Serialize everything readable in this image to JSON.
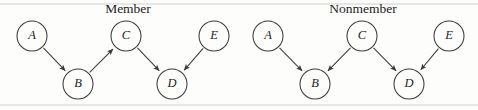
{
  "figure": {
    "width": 478,
    "height": 110,
    "background_color": "#fdfdfc",
    "stroke_color": "#3a3a3a",
    "rule_color": "#c9c9c7",
    "label_color": "#1c1c1c"
  },
  "rules": [
    {
      "name": "top-rule",
      "y": 4
    },
    {
      "name": "bottom-rule",
      "y": 105
    }
  ],
  "panels": [
    {
      "id": "member",
      "title": "Member",
      "title_x": 128,
      "title_y": 13,
      "nodes": [
        {
          "id": "A",
          "label": "A",
          "cx": 32,
          "cy": 36,
          "r": 15
        },
        {
          "id": "B",
          "label": "B",
          "cx": 78,
          "cy": 84,
          "r": 15
        },
        {
          "id": "C",
          "label": "C",
          "cx": 126,
          "cy": 36,
          "r": 15
        },
        {
          "id": "D",
          "label": "D",
          "cx": 172,
          "cy": 84,
          "r": 15
        },
        {
          "id": "E",
          "label": "E",
          "cx": 214,
          "cy": 36,
          "r": 15
        }
      ],
      "edges": [
        {
          "from": "A",
          "to": "B",
          "arrow": "to"
        },
        {
          "from": "B",
          "to": "C",
          "arrow": "to"
        },
        {
          "from": "C",
          "to": "D",
          "arrow": "to"
        },
        {
          "from": "E",
          "to": "D",
          "arrow": "to"
        }
      ]
    },
    {
      "id": "nonmember",
      "title": "Nonmember",
      "title_x": 363,
      "title_y": 13,
      "nodes": [
        {
          "id": "A",
          "label": "A",
          "cx": 268,
          "cy": 36,
          "r": 15
        },
        {
          "id": "B",
          "label": "B",
          "cx": 315,
          "cy": 84,
          "r": 15
        },
        {
          "id": "C",
          "label": "C",
          "cx": 362,
          "cy": 36,
          "r": 15
        },
        {
          "id": "D",
          "label": "D",
          "cx": 409,
          "cy": 84,
          "r": 15
        },
        {
          "id": "E",
          "label": "E",
          "cx": 449,
          "cy": 36,
          "r": 15
        }
      ],
      "edges": [
        {
          "from": "A",
          "to": "B",
          "arrow": "to"
        },
        {
          "from": "C",
          "to": "B",
          "arrow": "to"
        },
        {
          "from": "C",
          "to": "D",
          "arrow": "to"
        },
        {
          "from": "E",
          "to": "D",
          "arrow": "to"
        }
      ]
    }
  ]
}
